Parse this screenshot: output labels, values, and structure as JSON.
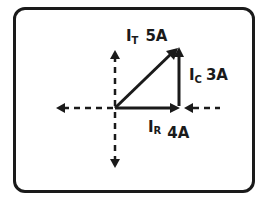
{
  "diagram": {
    "type": "phasor-diagram",
    "vectors": [
      {
        "name": "I_T",
        "symbol": "I",
        "subscript": "T",
        "value": "5A",
        "direction": "diagonal-up-right"
      },
      {
        "name": "I_C",
        "symbol": "I",
        "subscript": "C",
        "value": "3A",
        "direction": "up"
      },
      {
        "name": "I_R",
        "symbol": "I",
        "subscript": "R",
        "value": "4A",
        "direction": "right"
      }
    ],
    "labels": {
      "it_main": "I",
      "it_sub": "T",
      "it_value": "5A",
      "ic_main": "I",
      "ic_sub": "C",
      "ic_value": "3A",
      "ir_main": "I",
      "ir_sub": "R",
      "ir_value": "4A"
    },
    "colors": {
      "ink": "#1a1a1a",
      "background": "#ffffff"
    }
  }
}
